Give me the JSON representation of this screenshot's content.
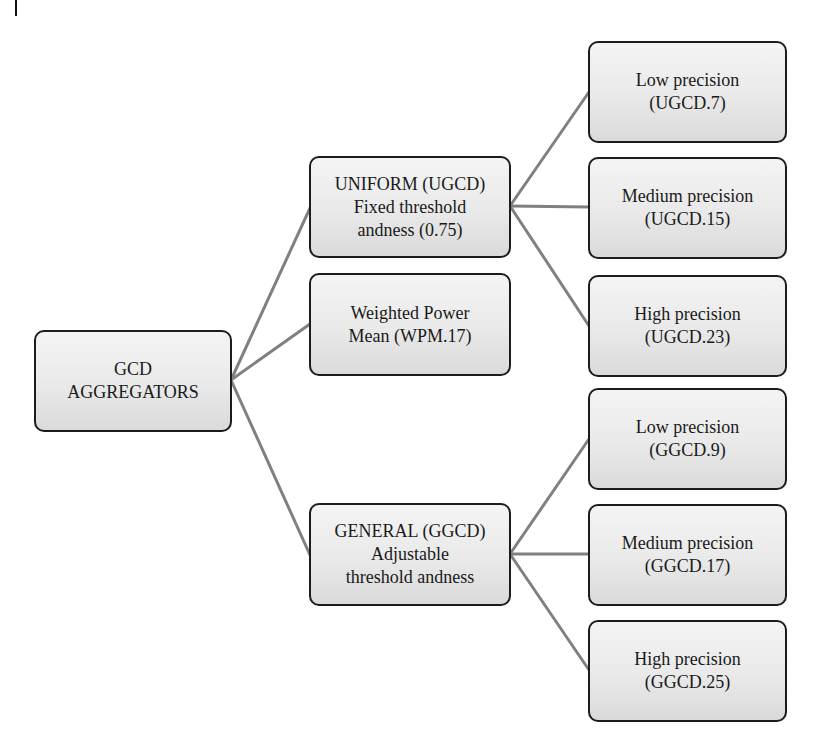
{
  "diagram": {
    "type": "tree",
    "root": {
      "id": "root",
      "label": "GCD\nAGGREGATORS"
    },
    "level1": [
      {
        "id": "uniform",
        "label": "UNIFORM (UGCD)\nFixed threshold\nandness (0.75)"
      },
      {
        "id": "wpm",
        "label": "Weighted Power\nMean (WPM.17)"
      },
      {
        "id": "general",
        "label": "GENERAL (GGCD)\nAdjustable\nthreshold andness"
      }
    ],
    "level2": {
      "uniform": [
        {
          "id": "ugcd-low",
          "label": "Low precision\n(UGCD.7)"
        },
        {
          "id": "ugcd-medium",
          "label": "Medium precision\n(UGCD.15)"
        },
        {
          "id": "ugcd-high",
          "label": "High precision\n(UGCD.23)"
        }
      ],
      "general": [
        {
          "id": "ggcd-low",
          "label": "Low precision\n(GGCD.9)"
        },
        {
          "id": "ggcd-medium",
          "label": "Medium precision\n(GGCD.17)"
        },
        {
          "id": "ggcd-high",
          "label": "High precision\n(GGCD.25)"
        }
      ]
    },
    "edges": [
      [
        "root",
        "uniform"
      ],
      [
        "root",
        "wpm"
      ],
      [
        "root",
        "general"
      ],
      [
        "uniform",
        "ugcd-low"
      ],
      [
        "uniform",
        "ugcd-medium"
      ],
      [
        "uniform",
        "ugcd-high"
      ],
      [
        "general",
        "ggcd-low"
      ],
      [
        "general",
        "ggcd-medium"
      ],
      [
        "general",
        "ggcd-high"
      ]
    ],
    "colors": {
      "connector": "#808080",
      "node_border": "#1c1c1c",
      "node_fill_top": "#f4f4f4",
      "node_fill_bottom": "#dadada",
      "text": "#1a1a1a"
    }
  }
}
